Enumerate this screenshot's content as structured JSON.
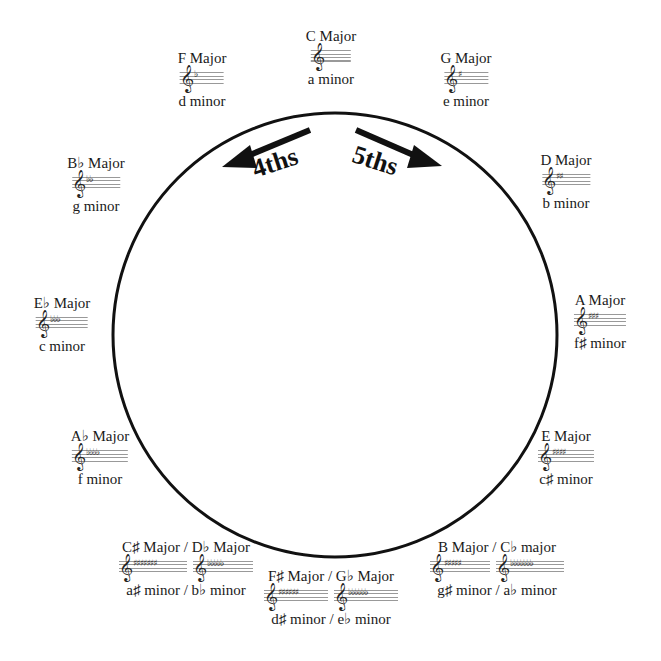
{
  "direction_labels": {
    "left": "4ths",
    "right": "5ths"
  },
  "keys": [
    {
      "id": "c",
      "major": "C Major",
      "minor": "a minor",
      "staffs": [
        ""
      ],
      "x": 331,
      "y": 28
    },
    {
      "id": "g",
      "major": "G Major",
      "minor": "e minor",
      "staffs": [
        "♯"
      ],
      "x": 466,
      "y": 50
    },
    {
      "id": "d",
      "major": "D Major",
      "minor": "b minor",
      "staffs": [
        "♯♯"
      ],
      "x": 566,
      "y": 152
    },
    {
      "id": "a",
      "major": "A Major",
      "minor": "f♯ minor",
      "staffs": [
        "♯♯♯"
      ],
      "x": 600,
      "y": 292
    },
    {
      "id": "e",
      "major": "E Major",
      "minor": "c♯ minor",
      "staffs": [
        "♯♯♯♯"
      ],
      "x": 566,
      "y": 428
    },
    {
      "id": "b",
      "major": "B Major / C♭ major",
      "minor": "g♯ minor / a♭ minor",
      "staffs": [
        "♯♯♯♯♯",
        "♭♭♭♭♭♭♭"
      ],
      "x": 497,
      "y": 539
    },
    {
      "id": "fs",
      "major": "F♯ Major / G♭ Major",
      "minor": "d♯ minor / e♭ minor",
      "staffs": [
        "♯♯♯♯♯♯",
        "♭♭♭♭♭♭"
      ],
      "x": 331,
      "y": 568
    },
    {
      "id": "cs",
      "major": "C♯ Major / D♭ Major",
      "minor": "a♯ minor / b♭ minor",
      "staffs": [
        "♯♯♯♯♯♯♯",
        "♭♭♭♭♭"
      ],
      "x": 186,
      "y": 539
    },
    {
      "id": "ab",
      "major": "A♭ Major",
      "minor": "f minor",
      "staffs": [
        "♭♭♭♭"
      ],
      "x": 100,
      "y": 428
    },
    {
      "id": "eb",
      "major": "E♭ Major",
      "minor": "c minor",
      "staffs": [
        "♭♭♭"
      ],
      "x": 62,
      "y": 295
    },
    {
      "id": "bb",
      "major": "B♭ Major",
      "minor": "g minor",
      "staffs": [
        "♭♭"
      ],
      "x": 96,
      "y": 155
    },
    {
      "id": "f",
      "major": "F Major",
      "minor": "d minor",
      "staffs": [
        "♭"
      ],
      "x": 202,
      "y": 50
    }
  ],
  "icons": {
    "clef": "treble-clef-icon",
    "arrow": "arrow-icon"
  }
}
